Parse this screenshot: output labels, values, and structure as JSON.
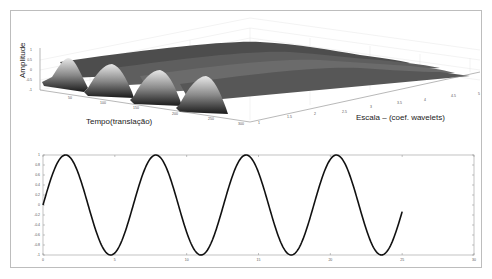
{
  "chart_data": [
    {
      "type": "surface",
      "title": "",
      "xlabel": "Tempo(translação)",
      "ylabel": "Escala – (coef. wavelets)",
      "zlabel": "Amplitude",
      "x_ticks": [
        "50",
        "100",
        "150",
        "200",
        "250",
        "300"
      ],
      "y_ticks": [
        "1",
        "1.5",
        "2",
        "2.5",
        "3",
        "3.5",
        "4",
        "4.5",
        "5"
      ],
      "z_ticks": [
        "1",
        "0.5",
        "0",
        "-0.5",
        "-1"
      ],
      "xlim": [
        0,
        300
      ],
      "ylim": [
        1,
        5
      ],
      "zlim": [
        -1,
        1
      ],
      "description": "Wavelet coefficient surface: sinusoidal ridges along time axis, decaying/smoothing with increasing scale",
      "grid": true,
      "colormap": "gray"
    },
    {
      "type": "line",
      "title": "",
      "xlabel": "",
      "ylabel": "",
      "x_ticks": [
        "0",
        "5",
        "10",
        "15",
        "20",
        "25",
        "30"
      ],
      "y_ticks": [
        "1",
        "0.8",
        "0.6",
        "0.4",
        "0.2",
        "0",
        "-0.2",
        "-0.4",
        "-0.6",
        "-0.8",
        "-1"
      ],
      "xlim": [
        0,
        30
      ],
      "ylim": [
        -1,
        1
      ],
      "series": [
        {
          "name": "sin(x)",
          "function": "sin(x)",
          "x_range": [
            0,
            25
          ],
          "x": [
            0,
            1.57,
            3.14,
            4.71,
            6.28,
            7.85,
            9.42,
            11.0,
            12.57,
            14.14,
            15.71,
            17.28,
            18.85,
            20.42,
            21.99,
            23.56,
            25
          ],
          "values": [
            0,
            1,
            0,
            -1,
            0,
            1,
            0,
            -1,
            0,
            1,
            0,
            -1,
            0,
            1,
            0,
            -1,
            -0.13
          ],
          "color": "#111111"
        }
      ],
      "grid": false
    }
  ]
}
